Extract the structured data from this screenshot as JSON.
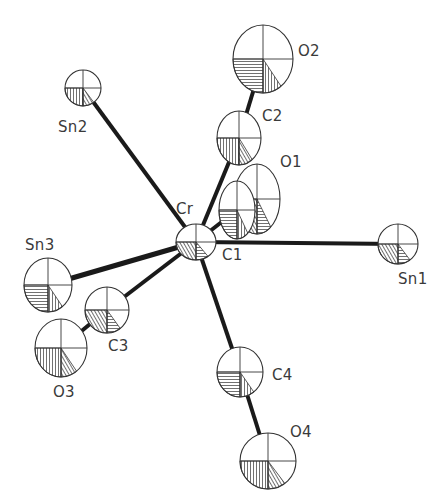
{
  "figure": {
    "type": "ORTEP thermal ellipsoid plot",
    "central_atom": "Cr",
    "background": "#ffffff",
    "line_color": "#1a1a1a"
  },
  "atoms": [
    {
      "id": "Cr",
      "label": "Cr",
      "x": 196,
      "y": 242,
      "rx": 20,
      "ry": 18,
      "label_x": 176,
      "label_y": 200
    },
    {
      "id": "Sn1",
      "label": "Sn1",
      "x": 398,
      "y": 244,
      "rx": 20,
      "ry": 20,
      "label_x": 398,
      "label_y": 270
    },
    {
      "id": "Sn2",
      "label": "Sn2",
      "x": 83,
      "y": 88,
      "rx": 18,
      "ry": 18,
      "label_x": 58,
      "label_y": 118
    },
    {
      "id": "Sn3",
      "label": "Sn3",
      "x": 48,
      "y": 285,
      "rx": 24,
      "ry": 27,
      "label_x": 25,
      "label_y": 236
    },
    {
      "id": "C1",
      "label": "C1",
      "x": 237,
      "y": 210,
      "rx": 18,
      "ry": 29,
      "label_x": 222,
      "label_y": 246
    },
    {
      "id": "O1",
      "label": "O1",
      "x": 257,
      "y": 199,
      "rx": 23,
      "ry": 35,
      "label_x": 280,
      "label_y": 153
    },
    {
      "id": "C2",
      "label": "C2",
      "x": 239,
      "y": 138,
      "rx": 22,
      "ry": 27,
      "label_x": 262,
      "label_y": 107
    },
    {
      "id": "O2",
      "label": "O2",
      "x": 263,
      "y": 59,
      "rx": 30,
      "ry": 34,
      "label_x": 298,
      "label_y": 42
    },
    {
      "id": "C3",
      "label": "C3",
      "x": 107,
      "y": 310,
      "rx": 22,
      "ry": 23,
      "label_x": 108,
      "label_y": 337
    },
    {
      "id": "O3",
      "label": "O3",
      "x": 61,
      "y": 348,
      "rx": 26,
      "ry": 29,
      "label_x": 53,
      "label_y": 383
    },
    {
      "id": "C4",
      "label": "C4",
      "x": 240,
      "y": 372,
      "rx": 23,
      "ry": 25,
      "label_x": 272,
      "label_y": 366
    },
    {
      "id": "O4",
      "label": "O4",
      "x": 268,
      "y": 461,
      "rx": 28,
      "ry": 28,
      "label_x": 290,
      "label_y": 423
    }
  ],
  "bonds": [
    {
      "from": "Cr",
      "to": "Sn1",
      "width": 4
    },
    {
      "from": "Cr",
      "to": "Sn2",
      "width": 4
    },
    {
      "from": "Cr",
      "to": "Sn3",
      "width": 5
    },
    {
      "from": "Cr",
      "to": "C1",
      "width": 4
    },
    {
      "from": "C1",
      "to": "O1",
      "width": 3
    },
    {
      "from": "Cr",
      "to": "C2",
      "width": 4
    },
    {
      "from": "C2",
      "to": "O2",
      "width": 4
    },
    {
      "from": "Cr",
      "to": "C3",
      "width": 4
    },
    {
      "from": "C3",
      "to": "O3",
      "width": 4
    },
    {
      "from": "Cr",
      "to": "C4",
      "width": 4
    },
    {
      "from": "C4",
      "to": "O4",
      "width": 4
    }
  ],
  "labels": {
    "Cr": "Cr",
    "Sn1": "Sn1",
    "Sn2": "Sn2",
    "Sn3": "Sn3",
    "C1": "C1",
    "O1": "O1",
    "C2": "C2",
    "O2": "O2",
    "C3": "C3",
    "O3": "O3",
    "C4": "C4",
    "O4": "O4"
  }
}
